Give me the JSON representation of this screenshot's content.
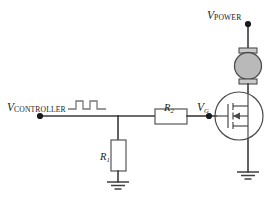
{
  "diagram": {
    "type": "schematic"
  },
  "labels": {
    "v_controller": {
      "symbol": "V",
      "subscript": "CONTROLLER"
    },
    "v_power": {
      "symbol": "V",
      "subscript": "POWER"
    },
    "v_gate": {
      "symbol": "V",
      "subscript": "G"
    },
    "r1": {
      "symbol": "R",
      "subscript": "1"
    },
    "r2": {
      "symbol": "R",
      "subscript": "2"
    }
  },
  "components": [
    {
      "id": "r1",
      "kind": "resistor",
      "orientation": "vertical",
      "label": "R1"
    },
    {
      "id": "r2",
      "kind": "resistor",
      "orientation": "horizontal",
      "label": "R2"
    },
    {
      "id": "motor",
      "kind": "dc-motor",
      "label": ""
    },
    {
      "id": "mosfet",
      "kind": "n-channel-mosfet",
      "label": ""
    },
    {
      "id": "gnd-left",
      "kind": "ground",
      "label": ""
    },
    {
      "id": "gnd-right",
      "kind": "ground",
      "label": ""
    }
  ],
  "nodes": [
    {
      "id": "controller-terminal",
      "kind": "terminal-dot"
    },
    {
      "id": "power-terminal",
      "kind": "terminal-dot"
    },
    {
      "id": "gate-node",
      "kind": "terminal-dot"
    }
  ],
  "waveform": {
    "name": "pwm-pulse-train",
    "kind": "square-pulses",
    "pulse_count": 2
  },
  "colors": {
    "wire": "#3a3a3a",
    "component_outline": "#555555",
    "motor_fill": "#b9b9b9",
    "waveform": "#777777",
    "background": "#ffffff",
    "text": "#1c1c1c"
  }
}
